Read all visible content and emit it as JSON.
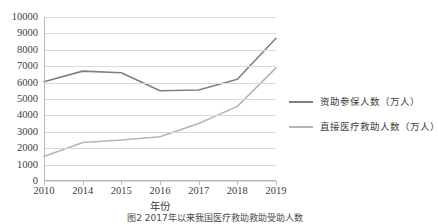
{
  "chart_data": {
    "type": "line",
    "title": "",
    "xlabel": "年份",
    "ylabel": "",
    "categories": [
      "2010",
      "2014",
      "2015",
      "2016",
      "2017",
      "2018",
      "2019"
    ],
    "ylim": [
      0,
      10000
    ],
    "ytick_step": 1000,
    "yticks": [
      "10000",
      "9000",
      "8000",
      "7000",
      "6000",
      "5000",
      "4000",
      "3000",
      "2000",
      "1000",
      "0"
    ],
    "grid": true,
    "legend_position": "right",
    "series": [
      {
        "name": "资助参保人数（万人）",
        "color": "#808080",
        "values": [
          6050,
          6700,
          6600,
          5500,
          5550,
          6200,
          8700
        ]
      },
      {
        "name": "直接医疗救助人数（万人）",
        "color": "#b5b5b5",
        "values": [
          1500,
          2350,
          2500,
          2700,
          3500,
          4550,
          6900
        ]
      }
    ]
  },
  "axis": {
    "x_title": "年份"
  },
  "caption": {
    "text": "图2  2017年以来我国医疗救助救助受助人数"
  },
  "colors": {
    "series_1": "#808080",
    "series_2": "#b5b5b5",
    "gridline": "#d9d9d9",
    "axis": "#b8b8b8",
    "text": "#3d3d3d",
    "background": "#ffffff"
  }
}
